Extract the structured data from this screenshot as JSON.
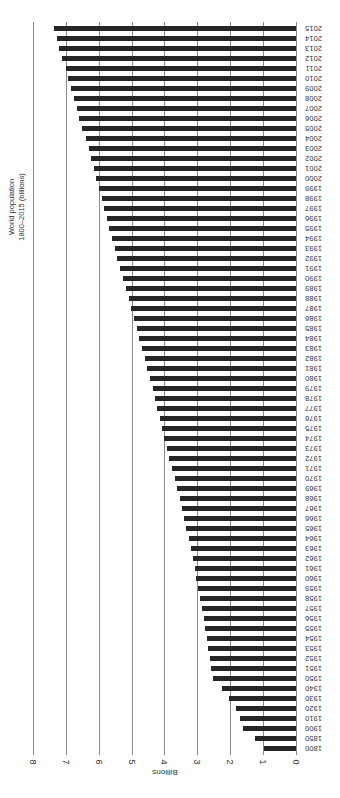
{
  "chart_data": {
    "type": "bar",
    "orientation": "rotated-90 (horizontal bars, years on right, value axis at bottom)",
    "title": "World population",
    "subtitle": "1800–2015 (billions)",
    "xlabel": "",
    "ylabel": "Billions",
    "ylim": [
      0,
      8
    ],
    "yticks": [
      0,
      1,
      2,
      3,
      4,
      5,
      6,
      7,
      8
    ],
    "grid": true,
    "legend": null,
    "categories": [
      "1800",
      "1850",
      "1900",
      "1910",
      "1920",
      "1930",
      "1940",
      "1950",
      "1951",
      "1952",
      "1953",
      "1954",
      "1955",
      "1956",
      "1957",
      "1958",
      "1959",
      "1960",
      "1961",
      "1962",
      "1963",
      "1964",
      "1965",
      "1966",
      "1967",
      "1968",
      "1969",
      "1970",
      "1971",
      "1972",
      "1973",
      "1974",
      "1975",
      "1976",
      "1977",
      "1978",
      "1979",
      "1980",
      "1981",
      "1982",
      "1983",
      "1984",
      "1985",
      "1986",
      "1987",
      "1988",
      "1989",
      "1990",
      "1991",
      "1992",
      "1993",
      "1994",
      "1995",
      "1996",
      "1997",
      "1998",
      "1999",
      "2000",
      "2001",
      "2002",
      "2003",
      "2004",
      "2005",
      "2006",
      "2007",
      "2008",
      "2009",
      "2010",
      "2011",
      "2012",
      "2013",
      "2014",
      "2015"
    ],
    "values": [
      0.98,
      1.26,
      1.6,
      1.7,
      1.83,
      2.03,
      2.25,
      2.52,
      2.57,
      2.62,
      2.67,
      2.71,
      2.76,
      2.81,
      2.87,
      2.92,
      2.97,
      3.03,
      3.08,
      3.14,
      3.2,
      3.26,
      3.33,
      3.4,
      3.47,
      3.54,
      3.62,
      3.69,
      3.77,
      3.85,
      3.92,
      4.0,
      4.07,
      4.14,
      4.22,
      4.29,
      4.36,
      4.44,
      4.52,
      4.6,
      4.68,
      4.76,
      4.84,
      4.92,
      5.01,
      5.09,
      5.18,
      5.26,
      5.35,
      5.43,
      5.51,
      5.59,
      5.67,
      5.75,
      5.83,
      5.91,
      5.99,
      6.07,
      6.14,
      6.22,
      6.3,
      6.38,
      6.5,
      6.6,
      6.67,
      6.75,
      6.85,
      6.93,
      7.0,
      7.11,
      7.19,
      7.27,
      7.35
    ],
    "bar_color": "#262626",
    "grid_color": "#8a8a8a"
  }
}
